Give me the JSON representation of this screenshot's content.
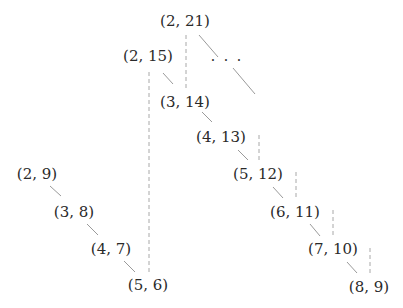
{
  "diagram": {
    "colors": {
      "text": "#2a2a2a",
      "solid_edge": "#9a9a9a",
      "dashed_edge": "#a8a8a8",
      "background": "#ffffff"
    },
    "nodes": [
      {
        "id": "n2_21",
        "label": "(2, 21)",
        "x": 185,
        "y": 12
      },
      {
        "id": "n2_15",
        "label": "(2, 15)",
        "x": 148,
        "y": 47
      },
      {
        "id": "n3_14",
        "label": "(3, 14)",
        "x": 185,
        "y": 93
      },
      {
        "id": "n4_13",
        "label": "(4, 13)",
        "x": 221,
        "y": 128
      },
      {
        "id": "n5_12",
        "label": "(5, 12)",
        "x": 258,
        "y": 165
      },
      {
        "id": "n6_11",
        "label": "(6, 11)",
        "x": 295,
        "y": 203
      },
      {
        "id": "n7_10",
        "label": "(7, 10)",
        "x": 333,
        "y": 240
      },
      {
        "id": "n8_9",
        "label": "(8, 9)",
        "x": 369,
        "y": 278
      },
      {
        "id": "n2_9",
        "label": "(2, 9)",
        "x": 37,
        "y": 165
      },
      {
        "id": "n3_8",
        "label": "(3, 8)",
        "x": 74,
        "y": 203
      },
      {
        "id": "n4_7",
        "label": "(4, 7)",
        "x": 111,
        "y": 240
      },
      {
        "id": "n5_6",
        "label": "(5, 6)",
        "x": 148,
        "y": 276
      }
    ],
    "ellipsis": {
      "label": "· · ·",
      "x": 227,
      "y": 52
    },
    "solid_edges": [
      {
        "from": "n2_21",
        "to": "ellipsis",
        "x1": 199,
        "y1": 35,
        "x2": 218,
        "y2": 57
      },
      {
        "from": "ellipsis",
        "to": "continuation",
        "x1": 233,
        "y1": 68,
        "x2": 255,
        "y2": 94
      },
      {
        "from": "n2_15",
        "to": "n3_14",
        "x1": 163,
        "y1": 73,
        "x2": 173,
        "y2": 84
      },
      {
        "from": "n3_14",
        "to": "n4_13",
        "x1": 202,
        "y1": 112,
        "x2": 212,
        "y2": 122
      },
      {
        "from": "n4_13",
        "to": "n5_12",
        "x1": 238,
        "y1": 150,
        "x2": 248,
        "y2": 160
      },
      {
        "from": "n5_12",
        "to": "n6_11",
        "x1": 273,
        "y1": 187,
        "x2": 283,
        "y2": 198
      },
      {
        "from": "n6_11",
        "to": "n7_10",
        "x1": 310,
        "y1": 224,
        "x2": 320,
        "y2": 236
      },
      {
        "from": "n7_10",
        "to": "n8_9",
        "x1": 347,
        "y1": 262,
        "x2": 357,
        "y2": 273
      },
      {
        "from": "n2_9",
        "to": "n3_8",
        "x1": 50,
        "y1": 186,
        "x2": 61,
        "y2": 196
      },
      {
        "from": "n3_8",
        "to": "n4_7",
        "x1": 87,
        "y1": 224,
        "x2": 98,
        "y2": 235
      },
      {
        "from": "n4_7",
        "to": "n5_6",
        "x1": 124,
        "y1": 261,
        "x2": 135,
        "y2": 272
      }
    ],
    "dashed_edges": [
      {
        "from": "n2_21",
        "to": "n3_14",
        "x1": 186,
        "y1": 35,
        "x2": 186,
        "y2": 88
      },
      {
        "from": "n2_15",
        "to": "n5_6",
        "x1": 149,
        "y1": 72,
        "x2": 149,
        "y2": 272
      },
      {
        "from": "n4_13",
        "to": "n5_12",
        "x1": 259,
        "y1": 135,
        "x2": 259,
        "y2": 161
      },
      {
        "from": "n5_12",
        "to": "n6_11",
        "x1": 296,
        "y1": 172,
        "x2": 296,
        "y2": 198
      },
      {
        "from": "n6_11",
        "to": "n7_10",
        "x1": 333,
        "y1": 210,
        "x2": 333,
        "y2": 236
      },
      {
        "from": "n7_10",
        "to": "n8_9",
        "x1": 370,
        "y1": 248,
        "x2": 370,
        "y2": 273
      }
    ]
  }
}
